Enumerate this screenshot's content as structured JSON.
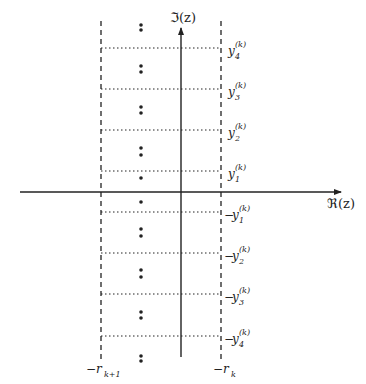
{
  "diagram": {
    "axes": {
      "imag_label": "ℑ(z)",
      "real_label": "ℜ(z)"
    },
    "vertical_bounds": {
      "left_label_main": "−r",
      "left_label_sub": "k+1",
      "right_label_main": "−r",
      "right_label_sub": "k"
    },
    "levels": [
      {
        "id": "y4",
        "sign": "",
        "base": "y",
        "sub": "4",
        "sup": "(k)"
      },
      {
        "id": "y3",
        "sign": "",
        "base": "y",
        "sub": "3",
        "sup": "(k)"
      },
      {
        "id": "y2",
        "sign": "",
        "base": "y",
        "sub": "2",
        "sup": "(k)"
      },
      {
        "id": "y1",
        "sign": "",
        "base": "y",
        "sub": "1",
        "sup": "(k)"
      },
      {
        "id": "neg-y1",
        "sign": "−",
        "base": "y",
        "sub": "1",
        "sup": "(k)"
      },
      {
        "id": "neg-y2",
        "sign": "−",
        "base": "y",
        "sub": "2",
        "sup": "(k)"
      },
      {
        "id": "neg-y3",
        "sign": "−",
        "base": "y",
        "sub": "3",
        "sup": "(k)"
      },
      {
        "id": "neg-y4",
        "sign": "−",
        "base": "y",
        "sub": "4",
        "sup": "(k)"
      }
    ],
    "colors": {
      "ink": "#222222",
      "background": "#ffffff"
    }
  }
}
